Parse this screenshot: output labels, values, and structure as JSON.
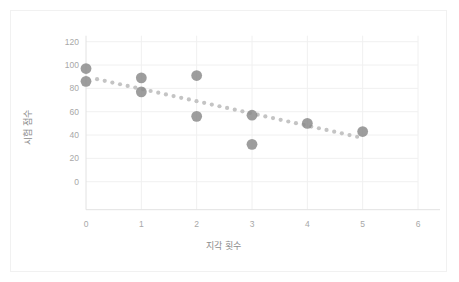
{
  "chart_data": {
    "type": "scatter",
    "title": "",
    "xlabel": "지각 횟수",
    "ylabel": "시험 점수",
    "x": [
      0,
      0,
      1,
      1,
      2,
      2,
      3,
      3,
      4,
      5
    ],
    "y": [
      97,
      86,
      89,
      77,
      91,
      56,
      57,
      32,
      50,
      43
    ],
    "points": [
      {
        "x": 0,
        "y": 97
      },
      {
        "x": 0,
        "y": 86
      },
      {
        "x": 1,
        "y": 89
      },
      {
        "x": 1,
        "y": 77
      },
      {
        "x": 2,
        "y": 91
      },
      {
        "x": 2,
        "y": 56
      },
      {
        "x": 3,
        "y": 57
      },
      {
        "x": 3,
        "y": 32
      },
      {
        "x": 4,
        "y": 50
      },
      {
        "x": 5,
        "y": 43
      }
    ],
    "trendline": {
      "type": "linear",
      "style": "dotted",
      "intercept": 90,
      "slope": -10.5,
      "x_start": 0.2,
      "x_end": 4.9
    },
    "xlim": [
      0,
      6
    ],
    "ylim": [
      0,
      120
    ],
    "xticks": [
      "0",
      "1",
      "2",
      "3",
      "4",
      "5",
      "6"
    ],
    "yticks": [
      "0",
      "20",
      "40",
      "60",
      "80",
      "100",
      "120"
    ],
    "grid": true,
    "legend": "none",
    "marker_color": "#8c8c8c",
    "trendline_color": "#c4c4c4",
    "grid_color": "#f0f0f0",
    "axis_color": "#e2e2e2",
    "tick_text_color": "#a8a8a8",
    "title_text_color": "#8c8c8c",
    "background": "#ffffff"
  }
}
